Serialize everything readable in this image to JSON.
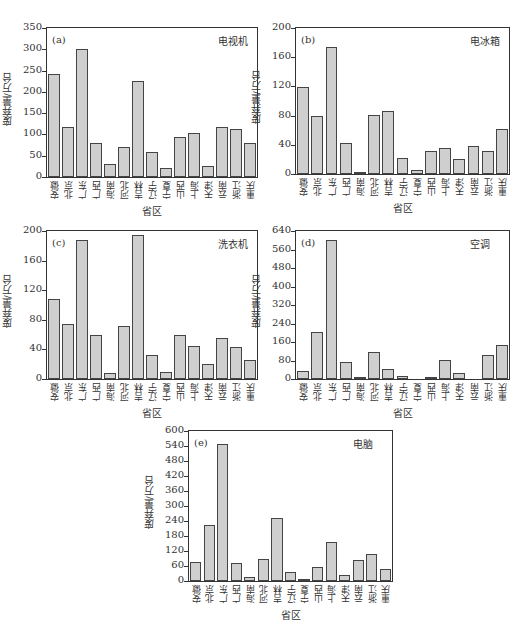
{
  "chart_data": [
    {
      "type": "bar",
      "panel": "(a)",
      "title": "电视机",
      "xlabel": "省区",
      "ylabel": "废弃量/万台",
      "ylim": [
        0,
        350
      ],
      "yticks": [
        0,
        50,
        100,
        150,
        200,
        250,
        300,
        350
      ],
      "categories": [
        "安徽",
        "北京",
        "广东",
        "广西",
        "海南",
        "河北",
        "吉林",
        "辽宁",
        "宁夏",
        "山西",
        "上海",
        "天津",
        "云南",
        "浙江",
        "重庆"
      ],
      "values": [
        243,
        117,
        300,
        80,
        30,
        70,
        226,
        58,
        21,
        93,
        103,
        26,
        118,
        112,
        79
      ]
    },
    {
      "type": "bar",
      "panel": "(b)",
      "title": "电冰箱",
      "xlabel": "省区",
      "ylabel": "废弃量/万台",
      "ylim": [
        0,
        200
      ],
      "yticks": [
        0,
        40,
        80,
        120,
        160,
        200
      ],
      "categories": [
        "安徽",
        "北京",
        "广东",
        "广西",
        "海南",
        "河北",
        "吉林",
        "辽宁",
        "宁夏",
        "山西",
        "上海",
        "天津",
        "云南",
        "浙江",
        "重庆"
      ],
      "values": [
        119,
        80,
        174,
        43,
        3,
        81,
        86,
        22,
        5,
        31,
        35,
        20,
        39,
        32,
        61
      ]
    },
    {
      "type": "bar",
      "panel": "(c)",
      "title": "洗衣机",
      "xlabel": "省区",
      "ylabel": "废弃量/万台",
      "ylim": [
        0,
        200
      ],
      "yticks": [
        0,
        40,
        80,
        120,
        160,
        200
      ],
      "categories": [
        "安徽",
        "北京",
        "广东",
        "广西",
        "海南",
        "河北",
        "吉林",
        "辽宁",
        "宁夏",
        "山西",
        "上海",
        "天津",
        "云南",
        "浙江",
        "重庆"
      ],
      "values": [
        108,
        75,
        188,
        60,
        8,
        72,
        194,
        33,
        10,
        60,
        45,
        20,
        55,
        43,
        26
      ]
    },
    {
      "type": "bar",
      "panel": "(d)",
      "title": "空调",
      "xlabel": "省区",
      "ylabel": "废弃量/万台",
      "ylim": [
        0,
        640
      ],
      "yticks": [
        0,
        80,
        160,
        240,
        320,
        400,
        480,
        560,
        640
      ],
      "categories": [
        "安徽",
        "北京",
        "广东",
        "广西",
        "海南",
        "河北",
        "吉林",
        "辽宁",
        "宁夏",
        "山西",
        "上海",
        "天津",
        "云南",
        "浙江",
        "重庆"
      ],
      "values": [
        33,
        205,
        600,
        73,
        6,
        116,
        42,
        12,
        0,
        8,
        82,
        27,
        0,
        103,
        145
      ]
    },
    {
      "type": "bar",
      "panel": "(e)",
      "title": "电脑",
      "xlabel": "省区",
      "ylabel": "废弃量/万台",
      "ylim": [
        0,
        600
      ],
      "yticks": [
        0,
        60,
        120,
        180,
        240,
        300,
        360,
        420,
        480,
        540,
        600
      ],
      "categories": [
        "安徽",
        "北京",
        "广东",
        "广西",
        "海南",
        "河北",
        "吉林",
        "辽宁",
        "宁夏",
        "山西",
        "上海",
        "天津",
        "云南",
        "浙江",
        "重庆"
      ],
      "values": [
        78,
        223,
        550,
        72,
        15,
        90,
        253,
        38,
        10,
        58,
        157,
        23,
        85,
        108,
        48
      ]
    }
  ],
  "layout": {
    "panels": [
      {
        "left": 46,
        "top": 27,
        "width": 212,
        "height": 151
      },
      {
        "left": 295,
        "top": 27,
        "width": 215,
        "height": 148
      },
      {
        "left": 46,
        "top": 230,
        "width": 212,
        "height": 150
      },
      {
        "left": 295,
        "top": 230,
        "width": 215,
        "height": 150
      },
      {
        "left": 188,
        "top": 430,
        "width": 205,
        "height": 152
      }
    ]
  }
}
